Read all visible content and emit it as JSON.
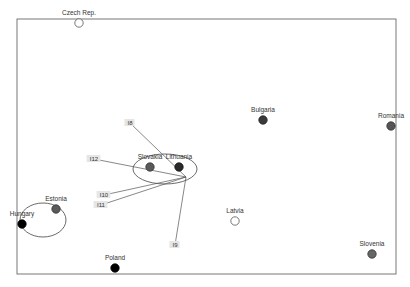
{
  "chart_data": {
    "type": "scatter",
    "title": "",
    "xlabel": "",
    "ylabel": "",
    "grid": false,
    "legend": null,
    "frame": {
      "left": 17,
      "top": 19,
      "right": 396,
      "bottom": 274
    },
    "points": [
      {
        "label": "Czech Rep.",
        "x": 79,
        "y": 23,
        "fill": "#ffffff",
        "stroke": "#555555",
        "hollow": true
      },
      {
        "label": "Bulgaria",
        "x": 263,
        "y": 120,
        "fill": "#3a3a3a",
        "stroke": "#222222",
        "hollow": false
      },
      {
        "label": "Romania",
        "x": 391,
        "y": 126,
        "fill": "#555555",
        "stroke": "#333333",
        "hollow": false
      },
      {
        "label": "Slovakia",
        "x": 150,
        "y": 167,
        "fill": "#5a5a5a",
        "stroke": "#333333",
        "hollow": false
      },
      {
        "label": "Lithuania",
        "x": 179,
        "y": 167,
        "fill": "#2a2a2a",
        "stroke": "#111111",
        "hollow": false
      },
      {
        "label": "Estonia",
        "x": 56,
        "y": 209,
        "fill": "#5a5a5a",
        "stroke": "#333333",
        "hollow": false
      },
      {
        "label": "Hungary",
        "x": 22,
        "y": 224,
        "fill": "#000000",
        "stroke": "#000000",
        "hollow": false
      },
      {
        "label": "Latvia",
        "x": 235,
        "y": 221,
        "fill": "#ffffff",
        "stroke": "#555555",
        "hollow": true
      },
      {
        "label": "Slovenia",
        "x": 372,
        "y": 254,
        "fill": "#666666",
        "stroke": "#333333",
        "hollow": false
      },
      {
        "label": "Poland",
        "x": 115,
        "y": 268,
        "fill": "#000000",
        "stroke": "#000000",
        "hollow": false
      }
    ],
    "clusters": [
      {
        "name": "cluster-slovakia-lithuania",
        "cx": 165,
        "cy": 169,
        "rx": 32,
        "ry": 15
      },
      {
        "name": "cluster-estonia-hungary",
        "cx": 43,
        "cy": 220,
        "rx": 23,
        "ry": 17
      }
    ],
    "vectors": {
      "origin": {
        "x": 186,
        "y": 177
      },
      "items": [
        {
          "label": "I8",
          "x": 130,
          "y": 123
        },
        {
          "label": "I12",
          "x": 94,
          "y": 159
        },
        {
          "label": "I10",
          "x": 104,
          "y": 195
        },
        {
          "label": "I11",
          "x": 101,
          "y": 205
        },
        {
          "label": "I9",
          "x": 175,
          "y": 245
        }
      ]
    }
  },
  "colors": {
    "frame": "#555555",
    "vector": "#555555",
    "ellipse": "#444444"
  }
}
